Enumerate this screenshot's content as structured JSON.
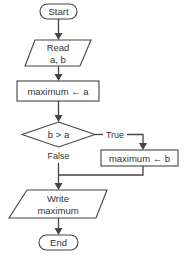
{
  "flowchart": {
    "start": {
      "label": "Start"
    },
    "read": {
      "line1": "Read",
      "line2": "a, b"
    },
    "assign_a": {
      "label": "maximum ← a"
    },
    "decision": {
      "label": "b > a",
      "true_label": "True",
      "false_label": "False"
    },
    "assign_b": {
      "label": "maximum ← b"
    },
    "write": {
      "line1": "Write",
      "line2": "maximum"
    },
    "end": {
      "label": "End"
    }
  },
  "colors": {
    "stroke": "#444444",
    "text": "#333333",
    "background": "#ffffff"
  }
}
